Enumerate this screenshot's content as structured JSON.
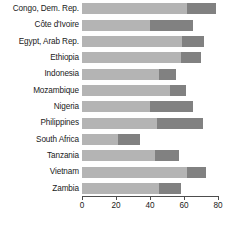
{
  "chart_data": {
    "type": "bar",
    "orientation": "horizontal",
    "stacked": true,
    "title": "",
    "subtitle": "",
    "xlabel": "",
    "ylabel": "",
    "xlim": [
      0,
      80
    ],
    "xticks": [
      0,
      20,
      40,
      60,
      80
    ],
    "xtick_labels": [
      "0",
      "20",
      "40",
      "60",
      "80"
    ],
    "grid": false,
    "legend": "none",
    "colors": {
      "segment_a": "#b4b4b4",
      "segment_b": "#818181",
      "axis": "#4d4d4d",
      "text": "#1a1a1a",
      "background": "#ffffff"
    },
    "categories": [
      "Congo, Dem. Rep.",
      "Côte d'Ivoire",
      "Egypt, Arab Rep.",
      "Ethiopia",
      "Indonesia",
      "Mozambique",
      "Nigeria",
      "Philippines",
      "South Africa",
      "Tanzania",
      "Vietnam",
      "Zambia"
    ],
    "series": [
      {
        "name": "segment-a",
        "values": [
          62,
          40,
          59,
          58,
          45,
          52,
          40,
          44,
          21,
          43,
          62,
          45
        ]
      },
      {
        "name": "segment-b",
        "values": [
          17,
          25,
          13,
          12,
          10,
          9,
          25,
          27,
          13,
          14,
          11,
          13
        ]
      }
    ],
    "totals": [
      79,
      65,
      72,
      70,
      55,
      61,
      65,
      71,
      34,
      57,
      73,
      58
    ]
  }
}
